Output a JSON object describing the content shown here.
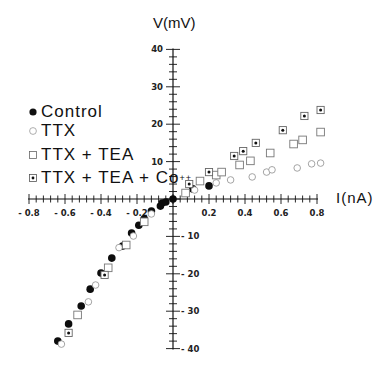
{
  "chart_data": {
    "type": "scatter",
    "title": "",
    "xlabel": "I(nA)",
    "ylabel": "V(mV)",
    "xlim": [
      -0.8,
      0.8
    ],
    "ylim": [
      -40,
      40
    ],
    "grid": false,
    "axes_style": "crossed at origin with tick marks",
    "legend_position": "upper-left",
    "x_ticks": [
      "-0.8",
      "-0.6",
      "-0.4",
      "-0.2",
      "0.2",
      "0.4",
      "0.6",
      "0.8"
    ],
    "y_ticks": [
      "40",
      "30",
      "20",
      "10",
      "-10",
      "-20",
      "-30",
      "-40"
    ],
    "series": [
      {
        "name": "Control",
        "marker": "filled-circle",
        "points": [
          [
            -0.64,
            -38.0
          ],
          [
            -0.58,
            -33.4
          ],
          [
            -0.51,
            -28.6
          ],
          [
            -0.46,
            -24.1
          ],
          [
            -0.4,
            -19.8
          ],
          [
            -0.34,
            -15.8
          ],
          [
            -0.28,
            -12.6
          ],
          [
            -0.23,
            -9.1
          ],
          [
            -0.19,
            -7.0
          ],
          [
            -0.16,
            -5.3
          ],
          [
            -0.12,
            -3.2
          ],
          [
            -0.07,
            -1.9
          ],
          [
            -0.06,
            -1.1
          ],
          [
            -0.04,
            -0.8
          ],
          [
            0.0,
            0.0
          ],
          [
            0.11,
            2.7
          ],
          [
            0.2,
            3.5
          ]
        ]
      },
      {
        "name": "TTX",
        "marker": "open-circle",
        "points": [
          [
            -0.62,
            -38.8
          ],
          [
            -0.47,
            -27.5
          ],
          [
            -0.43,
            -23.0
          ],
          [
            -0.3,
            -13.0
          ],
          [
            -0.22,
            -9.9
          ],
          [
            -0.12,
            -4.0
          ],
          [
            0.12,
            2.4
          ],
          [
            0.24,
            4.3
          ],
          [
            0.32,
            5.1
          ],
          [
            0.44,
            5.9
          ],
          [
            0.52,
            7.2
          ],
          [
            0.55,
            7.8
          ],
          [
            0.69,
            8.3
          ],
          [
            0.77,
            9.4
          ],
          [
            0.82,
            9.6
          ]
        ]
      },
      {
        "name": "TTX + TEA",
        "marker": "open-square",
        "points": [
          [
            -0.53,
            -31.0
          ],
          [
            -0.36,
            -18.4
          ],
          [
            -0.26,
            -12.3
          ],
          [
            -0.16,
            -6.1
          ],
          [
            0.07,
            1.6
          ],
          [
            0.15,
            4.8
          ],
          [
            0.24,
            6.4
          ],
          [
            0.27,
            7.2
          ],
          [
            0.37,
            9.1
          ],
          [
            0.43,
            10.2
          ],
          [
            0.54,
            12.3
          ],
          [
            0.67,
            14.7
          ],
          [
            0.72,
            15.8
          ],
          [
            0.82,
            17.9
          ]
        ]
      },
      {
        "name": "TTX + TEA + Co++",
        "marker": "dotted-square",
        "points": [
          [
            -0.58,
            -35.8
          ],
          [
            -0.38,
            -20.3
          ],
          [
            0.09,
            4.0
          ],
          [
            0.2,
            7.2
          ],
          [
            0.34,
            11.5
          ],
          [
            0.39,
            12.8
          ],
          [
            0.46,
            15.0
          ],
          [
            0.61,
            18.4
          ],
          [
            0.73,
            22.2
          ],
          [
            0.82,
            23.8
          ]
        ]
      }
    ]
  },
  "labels": {
    "ylabel": "V(mV)",
    "xlabel": "I(nA)",
    "legend": [
      {
        "text": "Control"
      },
      {
        "text": "TTX"
      },
      {
        "text": "TTX + TEA"
      },
      {
        "text": "TTX + TEA + Co",
        "sup": "++"
      }
    ]
  }
}
